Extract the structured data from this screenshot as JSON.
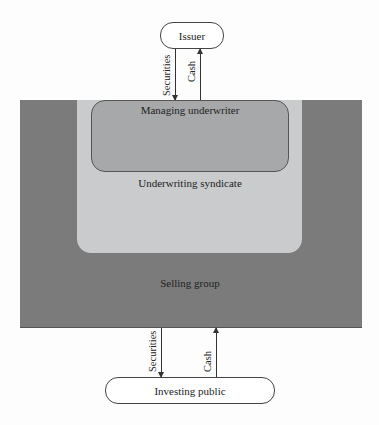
{
  "diagram": {
    "type": "nested-flow",
    "nodes": {
      "issuer": "Issuer",
      "investing_public": "Investing public"
    },
    "regions": {
      "selling_group": "Selling group",
      "underwriting_syndicate": "Underwriting syndicate",
      "managing_underwriter": "Managing underwriter"
    },
    "flows": {
      "top_securities": "Securities",
      "top_cash": "Cash",
      "bottom_securities": "Securities",
      "bottom_cash": "Cash"
    },
    "colors": {
      "selling_group": "#7b7b7b",
      "underwriting_syndicate": "#c9cbcd",
      "managing_underwriter": "#a6a8aa",
      "background": "#fdfdfd"
    }
  }
}
